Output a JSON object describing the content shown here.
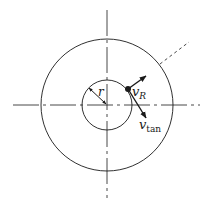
{
  "diagram": {
    "title": "",
    "labels": {
      "radius": "r",
      "radial_velocity_main": "v",
      "radial_velocity_sub": "R",
      "tangential_velocity_main": "v",
      "tangential_velocity_sub": "tan"
    },
    "elements": {
      "outer_circle": "outer-boundary",
      "inner_circle": "inner-circle",
      "horizontal_axis": "dash-dot-centerline",
      "vertical_axis": "dash-dot-centerline",
      "particle": "point-mass",
      "leader_line": "dashed-leader"
    },
    "colors": {
      "stroke": "#1a1a1a",
      "background": "#ffffff"
    }
  }
}
